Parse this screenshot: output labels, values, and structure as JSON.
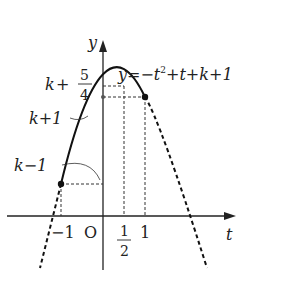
{
  "diagram": {
    "equation": {
      "lhs": "y",
      "eq": "=",
      "t2": "−t",
      "sup": "2",
      "rest": "+t+k+1"
    },
    "axes": {
      "x_label": "t",
      "y_label": "y",
      "origin": "O"
    },
    "y_labels": {
      "max": {
        "k": "k",
        "plus": "+",
        "num": "5",
        "den": "4"
      },
      "k_plus_1": "k+1",
      "k_minus_1": "k−1"
    },
    "x_ticks": {
      "minus_one": "−1",
      "half_num": "1",
      "half_den": "2",
      "one": "1"
    },
    "colors": {
      "line": "#111111",
      "dashed": "#333333",
      "background": "#ffffff"
    }
  }
}
